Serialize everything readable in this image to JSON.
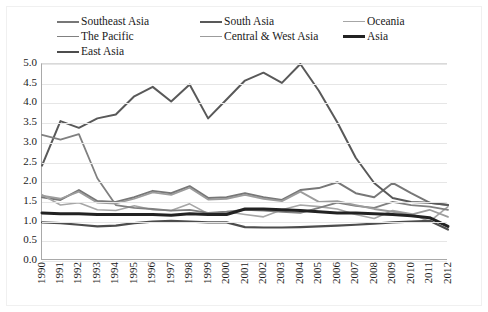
{
  "chart_data": {
    "type": "line",
    "title": "",
    "subtitle": "",
    "xlabel": "",
    "ylabel": "",
    "xlim": [
      1990,
      2012
    ],
    "ylim": [
      0.0,
      5.0
    ],
    "grid": true,
    "legend_position": "top",
    "x": [
      1990,
      1991,
      1992,
      1993,
      1994,
      1995,
      1996,
      1997,
      1998,
      1999,
      2000,
      2001,
      2002,
      2003,
      2004,
      2005,
      2006,
      2007,
      2008,
      2009,
      2010,
      2011,
      2012
    ],
    "categories": [
      "1990",
      "1991",
      "1992",
      "1993",
      "1994",
      "1995",
      "1996",
      "1997",
      "1998",
      "1999",
      "2000",
      "2001",
      "2002",
      "2003",
      "2004",
      "2005",
      "2006",
      "2007",
      "2008",
      "2009",
      "2010",
      "2011",
      "2012"
    ],
    "yticks": [
      "0.0",
      "0.5",
      "1.0",
      "1.5",
      "2.0",
      "2.5",
      "3.0",
      "3.5",
      "4.0",
      "4.5",
      "5.0"
    ],
    "ytick_values": [
      0.0,
      0.5,
      1.0,
      1.5,
      2.0,
      2.5,
      3.0,
      3.5,
      4.0,
      4.5,
      5.0
    ],
    "series": [
      {
        "name": "Southeast Asia",
        "color": "#777777",
        "width": 2.0,
        "values": [
          1.62,
          1.55,
          1.8,
          1.52,
          1.5,
          1.62,
          1.78,
          1.72,
          1.9,
          1.6,
          1.62,
          1.72,
          1.62,
          1.55,
          1.8,
          1.85,
          2.0,
          1.72,
          1.62,
          1.98,
          1.72,
          1.48,
          1.42
        ]
      },
      {
        "name": "South Asia",
        "color": "#595959",
        "width": 2.0,
        "values": [
          2.42,
          3.55,
          3.38,
          3.62,
          3.72,
          4.18,
          4.42,
          4.05,
          4.48,
          3.62,
          4.1,
          4.58,
          4.78,
          4.52,
          5.0,
          4.32,
          3.52,
          2.62,
          1.98,
          1.6,
          1.5,
          1.48,
          1.42
        ]
      },
      {
        "name": "Oceania",
        "color": "#a6a6a6",
        "width": 1.6,
        "values": [
          1.68,
          1.42,
          1.48,
          1.3,
          1.28,
          1.4,
          1.3,
          1.28,
          1.45,
          1.2,
          1.25,
          1.18,
          1.12,
          1.3,
          1.42,
          1.38,
          1.32,
          1.18,
          1.08,
          1.28,
          1.2,
          1.0,
          1.38
        ]
      },
      {
        "name": "The Pacific",
        "color": "#808080",
        "width": 1.8,
        "values": [
          3.2,
          3.08,
          3.22,
          2.1,
          1.42,
          1.35,
          1.32,
          1.28,
          1.3,
          1.22,
          1.25,
          1.3,
          1.28,
          1.25,
          1.22,
          1.35,
          1.48,
          1.4,
          1.35,
          1.5,
          1.42,
          1.38,
          1.3
        ]
      },
      {
        "name": "Central & West Asia",
        "color": "#9c9c9c",
        "width": 1.8,
        "values": [
          1.66,
          1.58,
          1.76,
          1.48,
          1.46,
          1.58,
          1.74,
          1.68,
          1.86,
          1.56,
          1.58,
          1.68,
          1.58,
          1.52,
          1.76,
          1.5,
          1.52,
          1.42,
          1.32,
          1.25,
          1.18,
          1.3,
          1.12
        ]
      },
      {
        "name": "Asia",
        "color": "#222222",
        "width": 3.0,
        "values": [
          1.22,
          1.2,
          1.2,
          1.18,
          1.18,
          1.18,
          1.18,
          1.16,
          1.2,
          1.18,
          1.18,
          1.32,
          1.32,
          1.3,
          1.28,
          1.25,
          1.22,
          1.22,
          1.2,
          1.18,
          1.15,
          1.1,
          0.88
        ]
      },
      {
        "name": "East Asia",
        "color": "#4d4d4d",
        "width": 2.2,
        "values": [
          0.98,
          0.96,
          0.92,
          0.88,
          0.9,
          0.96,
          1.0,
          1.02,
          1.0,
          0.98,
          0.98,
          0.86,
          0.85,
          0.85,
          0.86,
          0.88,
          0.9,
          0.92,
          0.95,
          0.98,
          1.0,
          1.02,
          0.8
        ]
      }
    ]
  },
  "legend": {
    "rows": [
      [
        {
          "label": "Southeast Asia",
          "color": "#777777",
          "width": 2.0,
          "left": 115
        },
        {
          "label": "South Asia",
          "color": "#595959",
          "width": 2.0,
          "left": 258
        },
        {
          "label": "Oceania",
          "color": "#a6a6a6",
          "width": 1.6,
          "left": 0
        }
      ],
      [
        {
          "label": "The Pacific",
          "color": "#808080",
          "width": 1.8,
          "left": 115
        },
        {
          "label": "Central & West Asia",
          "color": "#9c9c9c",
          "width": 1.8,
          "left": 258
        },
        {
          "label": "Asia",
          "color": "#222222",
          "width": 3.0,
          "left": 0
        }
      ],
      [
        {
          "label": "East Asia",
          "color": "#4d4d4d",
          "width": 2.2,
          "left": 0
        }
      ]
    ]
  }
}
